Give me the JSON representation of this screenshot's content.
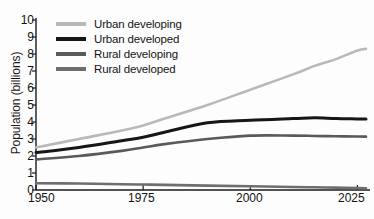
{
  "chart_data": {
    "type": "line",
    "title": "",
    "xlabel": "",
    "ylabel": "Population (billions)",
    "xlim": [
      1950,
      2027
    ],
    "ylim": [
      0,
      10
    ],
    "grid": false,
    "legend_position": "top-left",
    "xticks": [
      "1950",
      "1975",
      "2000",
      "2025"
    ],
    "xtick_values": [
      1950,
      1975,
      2000,
      2025
    ],
    "yticks": [
      "0",
      "1",
      "2",
      "3",
      "4",
      "5",
      "6",
      "7",
      "8",
      "9",
      "10"
    ],
    "ytick_values": [
      0,
      1,
      2,
      3,
      4,
      5,
      6,
      7,
      8,
      9,
      10
    ],
    "x": [
      1950,
      1960,
      1970,
      1975,
      1980,
      1990,
      2000,
      2010,
      2015,
      2020,
      2025,
      2027
    ],
    "series": [
      {
        "name": "Urban developing",
        "color": "#b9b9b9",
        "values": [
          2.5,
          3.0,
          3.5,
          3.8,
          4.2,
          5.0,
          5.9,
          6.8,
          7.3,
          7.7,
          8.2,
          8.3
        ]
      },
      {
        "name": "Urban developed",
        "color": "#161616",
        "values": [
          2.2,
          2.5,
          2.9,
          3.1,
          3.4,
          3.95,
          4.1,
          4.2,
          4.25,
          4.2,
          4.18,
          4.17
        ]
      },
      {
        "name": "Rural developing",
        "color": "#5a5a5a",
        "values": [
          1.8,
          2.0,
          2.3,
          2.5,
          2.7,
          3.0,
          3.2,
          3.2,
          3.18,
          3.16,
          3.15,
          3.14
        ]
      },
      {
        "name": "Rural developed",
        "color": "#6e6e6e",
        "values": [
          0.4,
          0.38,
          0.34,
          0.32,
          0.3,
          0.26,
          0.22,
          0.18,
          0.16,
          0.14,
          0.11,
          0.1
        ]
      }
    ]
  },
  "axes": {
    "ylabel": "Population (billions)",
    "ytick_labels": [
      "10",
      "9",
      "8",
      "7",
      "6",
      "5",
      "4",
      "3",
      "2",
      "1",
      "0"
    ],
    "xtick_labels": [
      "1950",
      "1975",
      "2000",
      "2025"
    ]
  },
  "legend": {
    "items": [
      {
        "label": "Urban developing",
        "color": "#b9b9b9"
      },
      {
        "label": "Urban developed",
        "color": "#161616"
      },
      {
        "label": "Rural developing",
        "color": "#5a5a5a"
      },
      {
        "label": "Rural developed",
        "color": "#6e6e6e"
      }
    ]
  }
}
